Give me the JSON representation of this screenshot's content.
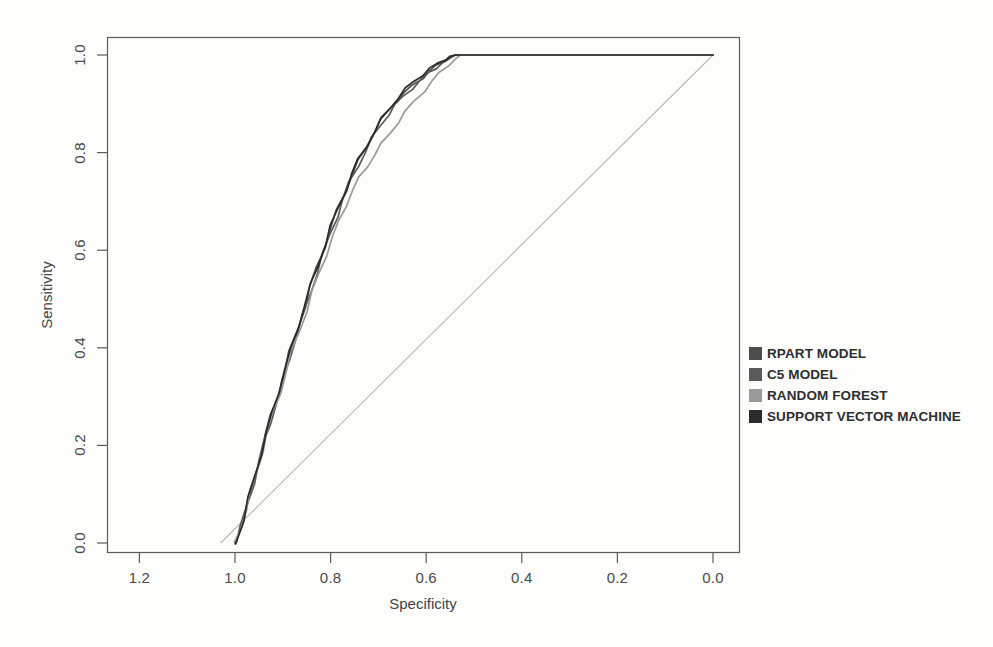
{
  "chart_data": {
    "type": "line",
    "title": "",
    "xlabel": "Specificity",
    "ylabel": "Sensitivity",
    "xlim": [
      1.3,
      -0.05
    ],
    "ylim": [
      0.0,
      1.0
    ],
    "x_ticks": [
      1.2,
      1.0,
      0.8,
      0.6,
      0.4,
      0.2,
      0.0
    ],
    "x_tick_labels": [
      "1.2",
      "1.0",
      "0.8",
      "0.6",
      "0.4",
      "0.2",
      "0.0"
    ],
    "y_ticks": [
      0.0,
      0.2,
      0.4,
      0.6,
      0.8,
      1.0
    ],
    "y_tick_labels": [
      "0.0",
      "0.2",
      "0.4",
      "0.6",
      "0.8",
      "1.0"
    ],
    "x_axis_reversed": true,
    "grid": false,
    "legend_position": "right",
    "reference_line": {
      "name": "chance-diagonal",
      "color": "#b8b8b8",
      "points": [
        [
          1.03,
          0.0
        ],
        [
          0.0,
          1.0
        ]
      ]
    },
    "series": [
      {
        "name": "RPART MODEL",
        "color": "#4e4e4e",
        "points": [
          [
            1.0,
            0.0
          ],
          [
            0.985,
            0.04
          ],
          [
            0.972,
            0.085
          ],
          [
            0.96,
            0.13
          ],
          [
            0.948,
            0.175
          ],
          [
            0.936,
            0.22
          ],
          [
            0.924,
            0.262
          ],
          [
            0.912,
            0.3
          ],
          [
            0.898,
            0.345
          ],
          [
            0.884,
            0.392
          ],
          [
            0.87,
            0.437
          ],
          [
            0.856,
            0.482
          ],
          [
            0.842,
            0.524
          ],
          [
            0.828,
            0.566
          ],
          [
            0.814,
            0.606
          ],
          [
            0.8,
            0.645
          ],
          [
            0.786,
            0.682
          ],
          [
            0.772,
            0.716
          ],
          [
            0.757,
            0.75
          ],
          [
            0.742,
            0.782
          ],
          [
            0.726,
            0.812
          ],
          [
            0.71,
            0.84
          ],
          [
            0.694,
            0.866
          ],
          [
            0.678,
            0.888
          ],
          [
            0.662,
            0.906
          ],
          [
            0.645,
            0.922
          ],
          [
            0.628,
            0.938
          ],
          [
            0.61,
            0.952
          ],
          [
            0.594,
            0.966
          ],
          [
            0.578,
            0.978
          ],
          [
            0.562,
            0.988
          ],
          [
            0.548,
            0.996
          ],
          [
            0.54,
            1.0
          ],
          [
            0.3,
            1.0
          ],
          [
            0.0,
            1.0
          ]
        ]
      },
      {
        "name": "C5 MODEL",
        "color": "#5a5a5a",
        "points": [
          [
            1.0,
            0.0
          ],
          [
            0.986,
            0.036
          ],
          [
            0.974,
            0.078
          ],
          [
            0.962,
            0.122
          ],
          [
            0.95,
            0.166
          ],
          [
            0.938,
            0.208
          ],
          [
            0.926,
            0.248
          ],
          [
            0.913,
            0.288
          ],
          [
            0.9,
            0.332
          ],
          [
            0.886,
            0.378
          ],
          [
            0.872,
            0.422
          ],
          [
            0.858,
            0.466
          ],
          [
            0.844,
            0.508
          ],
          [
            0.83,
            0.55
          ],
          [
            0.816,
            0.59
          ],
          [
            0.802,
            0.63
          ],
          [
            0.788,
            0.668
          ],
          [
            0.774,
            0.704
          ],
          [
            0.759,
            0.74
          ],
          [
            0.744,
            0.772
          ],
          [
            0.728,
            0.802
          ],
          [
            0.712,
            0.83
          ],
          [
            0.696,
            0.856
          ],
          [
            0.68,
            0.878
          ],
          [
            0.664,
            0.898
          ],
          [
            0.647,
            0.916
          ],
          [
            0.63,
            0.932
          ],
          [
            0.612,
            0.948
          ],
          [
            0.596,
            0.962
          ],
          [
            0.58,
            0.974
          ],
          [
            0.564,
            0.986
          ],
          [
            0.55,
            0.995
          ],
          [
            0.54,
            1.0
          ],
          [
            0.3,
            1.0
          ],
          [
            0.0,
            1.0
          ]
        ]
      },
      {
        "name": "RANDOM FOREST",
        "color": "#9a9a9a",
        "points": [
          [
            1.0,
            0.0
          ],
          [
            0.988,
            0.03
          ],
          [
            0.977,
            0.068
          ],
          [
            0.966,
            0.108
          ],
          [
            0.955,
            0.148
          ],
          [
            0.944,
            0.188
          ],
          [
            0.932,
            0.228
          ],
          [
            0.92,
            0.266
          ],
          [
            0.907,
            0.308
          ],
          [
            0.894,
            0.35
          ],
          [
            0.88,
            0.392
          ],
          [
            0.866,
            0.434
          ],
          [
            0.852,
            0.474
          ],
          [
            0.838,
            0.514
          ],
          [
            0.824,
            0.552
          ],
          [
            0.81,
            0.59
          ],
          [
            0.796,
            0.626
          ],
          [
            0.782,
            0.66
          ],
          [
            0.768,
            0.692
          ],
          [
            0.754,
            0.722
          ],
          [
            0.74,
            0.748
          ],
          [
            0.724,
            0.772
          ],
          [
            0.708,
            0.796
          ],
          [
            0.692,
            0.818
          ],
          [
            0.676,
            0.84
          ],
          [
            0.66,
            0.862
          ],
          [
            0.642,
            0.884
          ],
          [
            0.624,
            0.906
          ],
          [
            0.606,
            0.926
          ],
          [
            0.588,
            0.946
          ],
          [
            0.57,
            0.964
          ],
          [
            0.554,
            0.98
          ],
          [
            0.54,
            0.992
          ],
          [
            0.528,
            1.0
          ],
          [
            0.3,
            1.0
          ],
          [
            0.0,
            1.0
          ]
        ]
      },
      {
        "name": "SUPPORT VECTOR MACHINE",
        "color": "#2b2b2b",
        "points": [
          [
            1.0,
            0.0
          ],
          [
            0.984,
            0.044
          ],
          [
            0.971,
            0.092
          ],
          [
            0.958,
            0.138
          ],
          [
            0.946,
            0.182
          ],
          [
            0.934,
            0.226
          ],
          [
            0.922,
            0.268
          ],
          [
            0.909,
            0.31
          ],
          [
            0.896,
            0.354
          ],
          [
            0.882,
            0.4
          ],
          [
            0.868,
            0.444
          ],
          [
            0.854,
            0.488
          ],
          [
            0.84,
            0.53
          ],
          [
            0.826,
            0.572
          ],
          [
            0.812,
            0.612
          ],
          [
            0.798,
            0.65
          ],
          [
            0.784,
            0.686
          ],
          [
            0.77,
            0.722
          ],
          [
            0.755,
            0.756
          ],
          [
            0.74,
            0.788
          ],
          [
            0.724,
            0.816
          ],
          [
            0.708,
            0.844
          ],
          [
            0.692,
            0.87
          ],
          [
            0.676,
            0.892
          ],
          [
            0.66,
            0.912
          ],
          [
            0.643,
            0.93
          ],
          [
            0.626,
            0.946
          ],
          [
            0.608,
            0.96
          ],
          [
            0.592,
            0.972
          ],
          [
            0.576,
            0.982
          ],
          [
            0.56,
            0.992
          ],
          [
            0.546,
            0.998
          ],
          [
            0.536,
            1.0
          ],
          [
            0.3,
            1.0
          ],
          [
            0.0,
            1.0
          ]
        ]
      }
    ]
  },
  "legend": {
    "items": [
      {
        "label": "RPART MODEL",
        "color": "#4e4e4e"
      },
      {
        "label": "C5 MODEL",
        "color": "#5a5a5a"
      },
      {
        "label": "RANDOM FOREST",
        "color": "#9a9a9a"
      },
      {
        "label": "SUPPORT VECTOR MACHINE",
        "color": "#2b2b2b"
      }
    ]
  },
  "axes": {
    "x_title": "Specificity",
    "y_title": "Sensitivity"
  }
}
